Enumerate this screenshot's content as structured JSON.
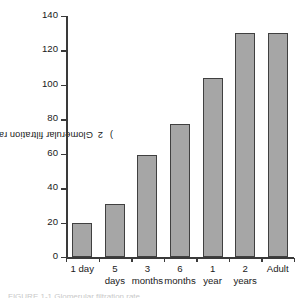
{
  "chart_data": {
    "type": "bar",
    "title": "",
    "subtitle": "",
    "xlabel": "",
    "ylabel": "Glomerular filtration rate (mL/minute/1.73 m2)",
    "ylabel_main": "Glomerular filtration rate (mL/minute/1.73 m",
    "ylabel_sup": "2",
    "ylabel_tail": ")",
    "categories": [
      "1 day",
      "5 days",
      "3 months",
      "6 months",
      "1 year",
      "2 years",
      "Adult"
    ],
    "category_lines": [
      [
        "1 day",
        ""
      ],
      [
        "5",
        "days"
      ],
      [
        "3",
        "months"
      ],
      [
        "6",
        "months"
      ],
      [
        "1",
        "year"
      ],
      [
        "2",
        "years"
      ],
      [
        "Adult",
        ""
      ]
    ],
    "values": [
      20,
      31,
      59,
      77,
      104,
      130,
      130
    ],
    "ylim": [
      0,
      140
    ],
    "ytick_values": [
      0,
      20,
      40,
      60,
      80,
      100,
      120,
      140
    ],
    "ytick_labels": [
      "0",
      "20",
      "40",
      "60",
      "80",
      "100",
      "120",
      "140"
    ],
    "grid": false,
    "legend": false,
    "legend_position": "none",
    "bar_fill_color": "#a6a6a6",
    "bar_edge_color": "#404040",
    "axis_color": "#3a3a3a",
    "background_color": "#ffffff"
  },
  "caption": {
    "partial_text": "FIGURE 1-1  Glomerular filtration rate"
  }
}
